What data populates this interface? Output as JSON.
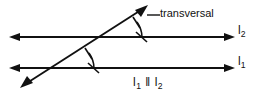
{
  "figure": {
    "background_color": "#ffffff",
    "stroke_color": "#111111",
    "labels": {
      "transversal": "transversal",
      "line_upper": "l",
      "line_upper_subscript": "2",
      "line_lower": "l",
      "line_lower_subscript": "1",
      "caption_left": "l",
      "caption_left_subscript": "1",
      "caption_symbol": "‖",
      "caption_right": "l",
      "caption_right_subscript": "2"
    },
    "geometry": {
      "line_upper": {
        "name": "l2",
        "y": 37,
        "x_start": 10,
        "x_end": 234,
        "arrow_left": true,
        "arrow_right": true
      },
      "line_lower": {
        "name": "l1",
        "y": 68,
        "x_start": 10,
        "x_end": 234,
        "arrow_left": true,
        "arrow_right": true
      },
      "transversal": {
        "x_start": 22,
        "y_start": 86,
        "x_end": 146,
        "y_end": 7,
        "arrow_start": true,
        "arrow_end": true
      },
      "intersection_upper": {
        "x": 115,
        "y": 37
      },
      "intersection_lower": {
        "x": 67,
        "y": 68
      },
      "angle_arc_radius": 26,
      "leader": {
        "x_start": 146,
        "y_start": 15,
        "x_end": 160,
        "y_end": 15
      }
    }
  }
}
